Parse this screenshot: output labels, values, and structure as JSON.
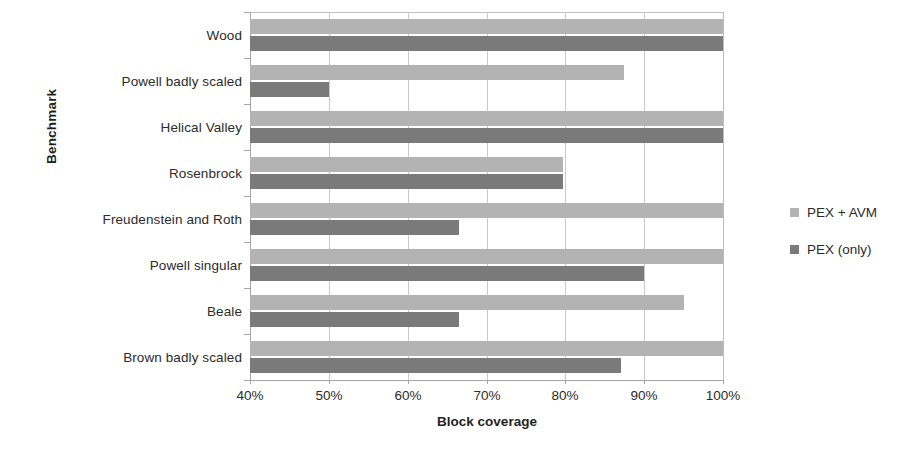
{
  "chart_data": {
    "type": "bar",
    "orientation": "horizontal",
    "title": "",
    "xlabel": "Block coverage",
    "ylabel": "Benchmark",
    "xlim": [
      40,
      100
    ],
    "xticks": [
      "40%",
      "50%",
      "60%",
      "70%",
      "80%",
      "90%",
      "100%"
    ],
    "xtick_values": [
      40,
      50,
      60,
      70,
      80,
      90,
      100
    ],
    "grid": true,
    "legend_position": "right",
    "categories": [
      "Wood",
      "Powell badly scaled",
      "Helical Valley",
      "Rosenbrock",
      "Freudenstein and Roth",
      "Powell singular",
      "Beale",
      "Brown badly scaled"
    ],
    "series": [
      {
        "name": "PEX + AVM",
        "color": "#b3b3b3",
        "values": [
          100,
          87.5,
          100,
          79.7,
          100,
          100,
          95,
          100
        ]
      },
      {
        "name": "PEX (only)",
        "color": "#7a7a7a",
        "values": [
          100,
          50,
          100,
          79.7,
          66.5,
          90,
          66.5,
          87
        ]
      }
    ]
  },
  "legend": {
    "items": [
      {
        "label": "PEX + AVM",
        "color": "#b3b3b3"
      },
      {
        "label": "PEX (only)",
        "color": "#7a7a7a"
      }
    ]
  },
  "axes": {
    "x_title": "Block coverage",
    "y_title": "Benchmark"
  }
}
